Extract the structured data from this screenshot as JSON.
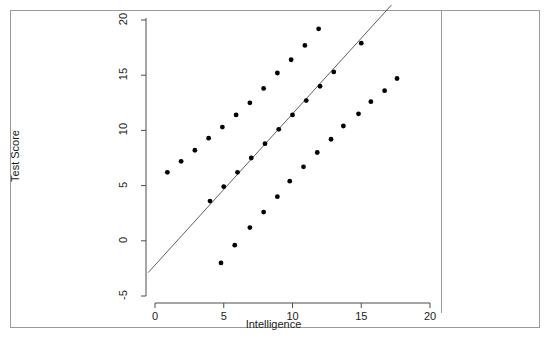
{
  "chart_data": {
    "type": "scatter",
    "title": "",
    "xlabel": "Intelligence",
    "ylabel": "Test Score",
    "xlim": [
      -0.8,
      20.8
    ],
    "ylim": [
      -6.2,
      21.2
    ],
    "xticks": [
      0,
      5,
      10,
      15,
      20
    ],
    "yticks": [
      -5,
      0,
      5,
      10,
      15,
      20
    ],
    "xtick_labels": [
      "0",
      "5",
      "10",
      "15",
      "20"
    ],
    "ytick_labels": [
      "-5",
      "0",
      "5",
      "10",
      "15",
      "20"
    ],
    "grid": false,
    "legend": "none",
    "point_color": "#000000",
    "line_color": "#4d4d4d",
    "series": [
      {
        "name": "upper-group",
        "marker": "filled-circle",
        "points": [
          {
            "x": 0.9,
            "y": 6.2
          },
          {
            "x": 1.9,
            "y": 7.2
          },
          {
            "x": 2.9,
            "y": 8.2
          },
          {
            "x": 3.9,
            "y": 9.3
          },
          {
            "x": 4.9,
            "y": 10.3
          },
          {
            "x": 5.9,
            "y": 11.4
          },
          {
            "x": 6.9,
            "y": 12.5
          },
          {
            "x": 7.9,
            "y": 13.8
          },
          {
            "x": 8.9,
            "y": 15.2
          },
          {
            "x": 9.9,
            "y": 16.4
          },
          {
            "x": 10.9,
            "y": 17.7
          },
          {
            "x": 11.9,
            "y": 19.2
          }
        ]
      },
      {
        "name": "middle-group",
        "marker": "filled-circle",
        "points": [
          {
            "x": 4.0,
            "y": 3.6
          },
          {
            "x": 5.0,
            "y": 4.9
          },
          {
            "x": 6.0,
            "y": 6.2
          },
          {
            "x": 7.0,
            "y": 7.5
          },
          {
            "x": 8.0,
            "y": 8.8
          },
          {
            "x": 9.0,
            "y": 10.1
          },
          {
            "x": 10.0,
            "y": 11.4
          },
          {
            "x": 11.0,
            "y": 12.7
          },
          {
            "x": 12.0,
            "y": 14.0
          },
          {
            "x": 13.0,
            "y": 15.3
          },
          {
            "x": 15.0,
            "y": 17.9
          }
        ]
      },
      {
        "name": "lower-group",
        "marker": "filled-circle",
        "points": [
          {
            "x": 4.8,
            "y": -2.0
          },
          {
            "x": 5.8,
            "y": -0.4
          },
          {
            "x": 6.9,
            "y": 1.2
          },
          {
            "x": 7.9,
            "y": 2.6
          },
          {
            "x": 8.9,
            "y": 4.0
          },
          {
            "x": 9.8,
            "y": 5.4
          },
          {
            "x": 10.8,
            "y": 6.7
          },
          {
            "x": 11.8,
            "y": 8.0
          },
          {
            "x": 12.8,
            "y": 9.2
          },
          {
            "x": 13.7,
            "y": 10.4
          },
          {
            "x": 14.8,
            "y": 11.5
          },
          {
            "x": 15.7,
            "y": 12.6
          },
          {
            "x": 16.7,
            "y": 13.6
          },
          {
            "x": 17.6,
            "y": 14.7
          }
        ]
      }
    ],
    "fit_line": {
      "name": "regression-line",
      "slope": 1.37,
      "intercept": -2.2,
      "x_start": -0.5,
      "x_end": 17.2
    }
  }
}
